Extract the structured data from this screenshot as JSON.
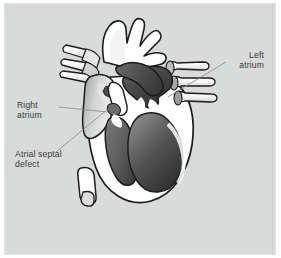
{
  "figure": {
    "background_color": "#d9dada",
    "border_color": "#ffffff",
    "label_color": "#3a3a3a",
    "leader_line_color": "#8a8a8a",
    "outline_color": "#1a1a1a",
    "wall_color": "#ffffff",
    "chamber_dark": "#4a4a4a",
    "chamber_light": "#c8c8c8"
  },
  "labels": {
    "right_atrium": "Right\natrium",
    "atrial_septal_defect": "Atrial septal\ndefect",
    "left_atrium": "Left\natrium"
  },
  "anatomy": {
    "parts": [
      "aortic-arch",
      "brachiocephalic-branches",
      "superior-vena-cava",
      "inferior-vena-cava",
      "pulmonary-veins-left",
      "pulmonary-veins-right",
      "right-atrium",
      "left-atrium",
      "right-ventricle",
      "left-ventricle",
      "interatrial-septum",
      "atrial-septal-defect",
      "tricuspid-valve",
      "mitral-valve"
    ]
  }
}
